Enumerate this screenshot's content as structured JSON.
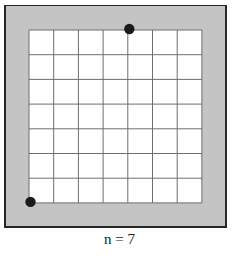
{
  "figure": {
    "caption": "n = 7",
    "n": 7,
    "colors": {
      "frame_fill": "#c4c4c4",
      "frame_border": "#262626",
      "grid_fill": "#ffffff",
      "grid_line": "#6e6e6e",
      "dot": "#1a1a1a"
    },
    "grid": {
      "left": 29,
      "top": 30,
      "cell": 24.7
    },
    "points": [
      {
        "label": "top-dot",
        "col": 4,
        "row": 0
      },
      {
        "label": "bottom-left-dot",
        "col": 0,
        "row": 7
      }
    ]
  }
}
